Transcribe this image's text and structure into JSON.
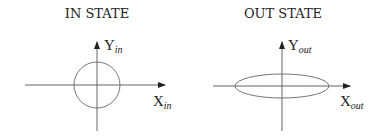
{
  "panels": [
    {
      "title": "IN STATE",
      "y_axis": {
        "main": "Y",
        "sub": "in"
      },
      "x_axis": {
        "main": "X",
        "sub": "in"
      },
      "shape": "circle"
    },
    {
      "title": "OUT STATE",
      "y_axis": {
        "main": "Y",
        "sub": "out"
      },
      "x_axis": {
        "main": "X",
        "sub": "out"
      },
      "shape": "ellipse"
    }
  ],
  "colors": {
    "line": "#555555",
    "text": "#222222"
  }
}
